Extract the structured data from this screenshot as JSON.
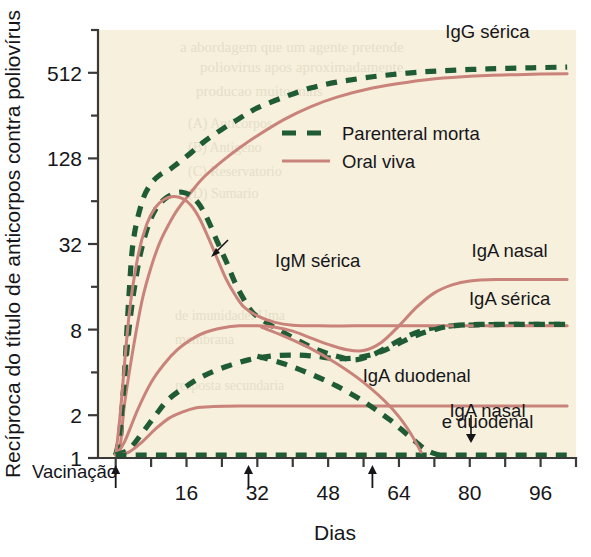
{
  "chart_data": {
    "type": "line",
    "title": "",
    "xlabel": "Dias",
    "ylabel": "Recíproca do título de anticorpos contra poliovírus",
    "y_scale": "log2",
    "ylim": [
      1,
      1024
    ],
    "xlim": [
      -4,
      104
    ],
    "grid": false,
    "background_color": "#f7f0dd",
    "y_ticks_labeled": [
      "1",
      "2",
      "8",
      "32",
      "128",
      "512"
    ],
    "y_tick_values": [
      1,
      2,
      8,
      32,
      128,
      512
    ],
    "y_minor_tick_values": [
      4,
      16,
      64,
      256,
      1024
    ],
    "x_ticks_labeled": [
      "16",
      "32",
      "48",
      "64",
      "80",
      "96"
    ],
    "x_tick_values": [
      16,
      32,
      48,
      64,
      80,
      96
    ],
    "x_minor_tick_values": [
      8,
      24,
      40,
      56,
      72,
      88,
      104
    ],
    "legend": {
      "position": "upper-center",
      "entries": [
        {
          "label": "Parenteral morta",
          "style": "dashed",
          "color": "#1f5c35"
        },
        {
          "label": "Oral viva",
          "style": "solid",
          "color": "#c9837a"
        }
      ]
    },
    "vaccination_label": "Vacinação",
    "vaccination_doses_days": [
      0,
      30,
      58
    ],
    "annotations": [
      {
        "text": "IgG sérica",
        "x": 84,
        "y": 900,
        "anchor": "middle"
      },
      {
        "text": "IgM sérica",
        "x": 36,
        "y": 22,
        "anchor": "start"
      },
      {
        "text": "IgA nasal",
        "x": 89,
        "y": 26,
        "anchor": "middle"
      },
      {
        "text": "IgA sérica",
        "x": 89,
        "y": 12,
        "anchor": "middle"
      },
      {
        "text": "IgA duodenal",
        "x": 68,
        "y": 3.4,
        "anchor": "middle"
      },
      {
        "text": "IgA nasal",
        "x": 84,
        "y": 1.95,
        "anchor": "middle"
      },
      {
        "text": "e duodenal",
        "x": 84,
        "y": 1.62,
        "anchor": "middle"
      }
    ],
    "series": [
      {
        "name": "IgG sérica - Parenteral morta",
        "style": "dashed",
        "color": "#1f5c35",
        "points": [
          [
            0,
            1.05
          ],
          [
            1,
            1.3
          ],
          [
            2,
            4
          ],
          [
            3,
            14
          ],
          [
            4,
            34
          ],
          [
            6,
            64
          ],
          [
            8,
            85
          ],
          [
            10,
            98
          ],
          [
            12,
            106
          ],
          [
            14,
            118
          ],
          [
            17,
            140
          ],
          [
            20,
            168
          ],
          [
            24,
            205
          ],
          [
            28,
            245
          ],
          [
            32,
            290
          ],
          [
            38,
            345
          ],
          [
            44,
            400
          ],
          [
            50,
            440
          ],
          [
            58,
            480
          ],
          [
            66,
            510
          ],
          [
            74,
            530
          ],
          [
            84,
            545
          ],
          [
            94,
            555
          ],
          [
            102,
            562
          ]
        ]
      },
      {
        "name": "IgG sérica - Oral viva",
        "style": "solid",
        "color": "#c9837a",
        "points": [
          [
            0,
            1.05
          ],
          [
            1,
            1.2
          ],
          [
            2,
            2.4
          ],
          [
            4,
            6
          ],
          [
            6,
            13
          ],
          [
            8,
            22
          ],
          [
            10,
            33
          ],
          [
            12,
            44
          ],
          [
            14,
            56
          ],
          [
            17,
            74
          ],
          [
            20,
            95
          ],
          [
            24,
            122
          ],
          [
            28,
            152
          ],
          [
            32,
            185
          ],
          [
            38,
            240
          ],
          [
            44,
            295
          ],
          [
            50,
            345
          ],
          [
            58,
            400
          ],
          [
            66,
            440
          ],
          [
            74,
            470
          ],
          [
            84,
            490
          ],
          [
            94,
            500
          ],
          [
            102,
            505
          ]
        ]
      },
      {
        "name": "IgM sérica - Parenteral morta",
        "style": "dashed",
        "color": "#1f5c35",
        "points": [
          [
            0,
            1.05
          ],
          [
            1,
            1.6
          ],
          [
            3,
            8
          ],
          [
            5,
            22
          ],
          [
            7,
            40
          ],
          [
            9,
            56
          ],
          [
            11,
            66
          ],
          [
            13,
            72
          ],
          [
            15,
            74
          ],
          [
            17,
            70
          ],
          [
            19,
            60
          ],
          [
            21,
            46
          ],
          [
            23,
            33
          ],
          [
            25,
            24
          ],
          [
            27,
            17
          ],
          [
            29,
            13
          ],
          [
            31,
            10.5
          ],
          [
            34,
            9
          ],
          [
            38,
            7.6
          ],
          [
            42,
            6.5
          ],
          [
            46,
            5.7
          ],
          [
            50,
            5.2
          ],
          [
            54,
            4.9
          ],
          [
            58,
            5.3
          ],
          [
            62,
            6.2
          ],
          [
            66,
            7.2
          ],
          [
            70,
            8
          ],
          [
            74,
            8.4
          ],
          [
            80,
            8.6
          ],
          [
            90,
            8.7
          ],
          [
            102,
            8.7
          ]
        ]
      },
      {
        "name": "IgM sérica - Oral viva",
        "style": "solid",
        "color": "#c9837a",
        "points": [
          [
            0,
            1.05
          ],
          [
            1,
            2
          ],
          [
            3,
            10
          ],
          [
            5,
            26
          ],
          [
            7,
            44
          ],
          [
            9,
            58
          ],
          [
            11,
            66
          ],
          [
            13,
            69
          ],
          [
            15,
            67
          ],
          [
            17,
            60
          ],
          [
            19,
            48
          ],
          [
            21,
            35
          ],
          [
            23,
            25
          ],
          [
            25,
            18
          ],
          [
            27,
            14
          ],
          [
            29,
            11.5
          ],
          [
            32,
            10
          ],
          [
            36,
            9
          ],
          [
            40,
            8.6
          ],
          [
            46,
            8.5
          ],
          [
            54,
            8.5
          ],
          [
            64,
            8.5
          ],
          [
            76,
            8.5
          ],
          [
            90,
            8.5
          ],
          [
            102,
            8.5
          ]
        ]
      },
      {
        "name": "IgA nasal - Oral viva",
        "style": "solid",
        "color": "#c9837a",
        "points": [
          [
            0,
            1.05
          ],
          [
            2,
            1.3
          ],
          [
            5,
            2.2
          ],
          [
            8,
            3.4
          ],
          [
            11,
            4.6
          ],
          [
            14,
            5.8
          ],
          [
            17,
            6.8
          ],
          [
            20,
            7.6
          ],
          [
            24,
            8.2
          ],
          [
            28,
            8.5
          ],
          [
            32,
            8.5
          ],
          [
            36,
            8.3
          ],
          [
            40,
            7.8
          ],
          [
            44,
            7
          ],
          [
            48,
            6.3
          ],
          [
            52,
            5.8
          ],
          [
            56,
            5.7
          ],
          [
            60,
            6.5
          ],
          [
            64,
            8.5
          ],
          [
            68,
            11.5
          ],
          [
            72,
            14.5
          ],
          [
            76,
            16.5
          ],
          [
            80,
            17.6
          ],
          [
            86,
            18
          ],
          [
            94,
            18
          ],
          [
            102,
            18
          ]
        ]
      },
      {
        "name": "IgA sérica - Parenteral morta",
        "style": "dashed",
        "color": "#1f5c35",
        "points": [
          [
            0,
            1.05
          ],
          [
            3,
            1.15
          ],
          [
            6,
            1.5
          ],
          [
            9,
            2
          ],
          [
            12,
            2.6
          ],
          [
            16,
            3.2
          ],
          [
            20,
            3.8
          ],
          [
            25,
            4.4
          ],
          [
            30,
            4.9
          ],
          [
            35,
            5.2
          ],
          [
            40,
            5.3
          ],
          [
            45,
            5.2
          ],
          [
            50,
            5
          ],
          [
            55,
            5.1
          ],
          [
            60,
            5.6
          ],
          [
            64,
            6.4
          ],
          [
            68,
            7.3
          ],
          [
            72,
            8
          ],
          [
            76,
            8.5
          ],
          [
            82,
            8.7
          ],
          [
            90,
            8.7
          ],
          [
            102,
            8.7
          ]
        ]
      },
      {
        "name": "IgA duodenal - Oral viva",
        "style": "solid",
        "color": "#c9837a",
        "points": [
          [
            0,
            1.05
          ],
          [
            3,
            1.1
          ],
          [
            6,
            1.3
          ],
          [
            9,
            1.6
          ],
          [
            12,
            1.9
          ],
          [
            15,
            2.1
          ],
          [
            18,
            2.25
          ],
          [
            22,
            2.3
          ],
          [
            28,
            2.32
          ],
          [
            36,
            2.32
          ],
          [
            46,
            2.32
          ],
          [
            56,
            2.32
          ],
          [
            66,
            2.32
          ],
          [
            76,
            2.32
          ],
          [
            86,
            2.32
          ],
          [
            94,
            2.32
          ],
          [
            102,
            2.32
          ]
        ]
      },
      {
        "name": "IgA duodenal decline - Parenteral morta",
        "style": "dashed",
        "color": "#1f5c35",
        "points": [
          [
            32,
            5.2
          ],
          [
            38,
            4.6
          ],
          [
            44,
            3.9
          ],
          [
            50,
            3.2
          ],
          [
            56,
            2.5
          ],
          [
            62,
            1.85
          ],
          [
            66,
            1.45
          ],
          [
            70,
            1.15
          ],
          [
            73,
            1.05
          ]
        ]
      },
      {
        "name": "IgA nasal e duodenal - Parenteral morta (baseline)",
        "style": "dashed",
        "color": "#1f5c35",
        "points": [
          [
            0,
            1.05
          ],
          [
            10,
            1.05
          ],
          [
            20,
            1.05
          ],
          [
            30,
            1.05
          ],
          [
            40,
            1.05
          ],
          [
            50,
            1.05
          ],
          [
            60,
            1.05
          ],
          [
            70,
            1.05
          ],
          [
            80,
            1.05
          ],
          [
            90,
            1.05
          ],
          [
            102,
            1.05
          ]
        ]
      },
      {
        "name": "IgA nasal decline - Oral viva (secondary)",
        "style": "solid",
        "color": "#c9837a",
        "points": [
          [
            33,
            8.3
          ],
          [
            38,
            7.2
          ],
          [
            44,
            5.9
          ],
          [
            50,
            4.6
          ],
          [
            56,
            3.4
          ],
          [
            62,
            2.3
          ],
          [
            66,
            1.6
          ],
          [
            69,
            1.1
          ]
        ]
      }
    ]
  },
  "ghost_text": {
    "lines": [
      "a abordagem que um agente pretende",
      "poliovirus apos aproximadamente",
      "producao muito mais",
      "(A) Anticorpos",
      "(B) Antigeno",
      "(C) Reservatorio",
      "(D) Sumario",
      "de imunidade. Uma",
      "membrana",
      "resposta secundaria"
    ]
  }
}
